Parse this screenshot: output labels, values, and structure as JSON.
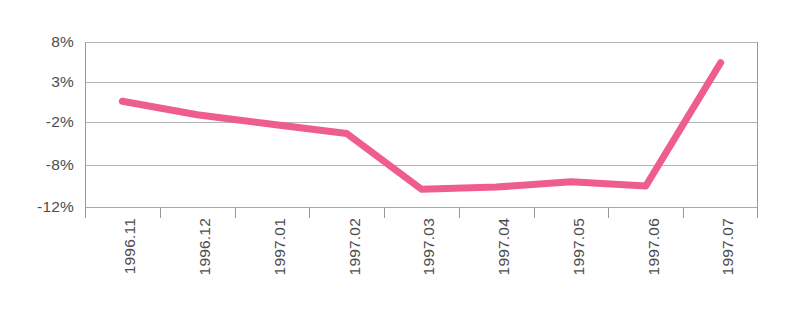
{
  "chart_data": {
    "type": "line",
    "title": "",
    "subtitle": "",
    "xlabel": "",
    "ylabel": "",
    "categories": [
      "1996.11",
      "1996.12",
      "1997.01",
      "1997.02",
      "1997.03",
      "1997.04",
      "1997.05",
      "1997.06",
      "1997.07"
    ],
    "series": [
      {
        "name": "",
        "color": "#ee5d8c",
        "values": [
          0.6,
          -1.1,
          -2.3,
          -3.6,
          -10.3,
          -10.1,
          -9.6,
          -10.0,
          5.4
        ]
      }
    ],
    "ytick_labels": [
      "8%",
      "3%",
      "-2%",
      "-8%",
      "-12%"
    ],
    "ytick_values": [
      8,
      3,
      -2,
      -8,
      -12
    ],
    "ylim": [
      -12,
      8
    ],
    "grid": true,
    "legend": "none",
    "annotations": []
  },
  "style": {
    "line_color": "#ee5d8c",
    "grid_color": "#a8a8a8",
    "axis_color": "#9a9a9a",
    "text_color": "#4d4d4d",
    "background": "#ffffff"
  }
}
